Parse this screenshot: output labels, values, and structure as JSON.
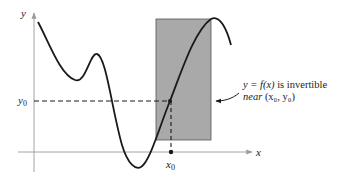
{
  "diagram": {
    "axes": {
      "x_label": "x",
      "y_label": "y",
      "axis_color": "#9a9a9a"
    },
    "markers": {
      "x0_label": "x",
      "x0_sub": "0",
      "y0_label": "y",
      "y0_sub": "0"
    },
    "annotation": {
      "line1_pre": "y = ",
      "line1_fx": "f(x)",
      "line1_post": " is invertible",
      "line2_near": "near",
      "line2_point": "(x₀, y₀)"
    },
    "colors": {
      "curve": "#1a1a1a",
      "box_fill": "#a9a9a9",
      "box_stroke": "#555555",
      "dashed": "#1a1a1a"
    }
  }
}
